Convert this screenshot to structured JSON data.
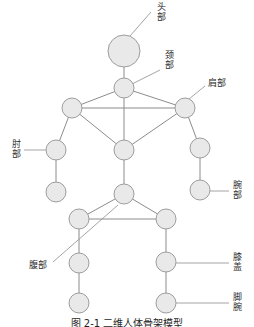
{
  "figure": {
    "caption": "图 2-1  二维人体骨架模型",
    "background_color": "#ffffff",
    "node_fill": "#e9e9e9",
    "node_stroke": "#9d9d9d",
    "edge_color": "#8c8c8c",
    "leader_color": "#9a9a9a"
  },
  "joints": [
    {
      "id": "head",
      "name": "head-joint",
      "cx": 124,
      "cy": 51,
      "r": 16
    },
    {
      "id": "neck",
      "name": "neck-joint",
      "cx": 124,
      "cy": 88,
      "r": 10
    },
    {
      "id": "shoulder_left",
      "name": "left-shoulder-joint",
      "cx": 72,
      "cy": 108,
      "r": 10
    },
    {
      "id": "shoulder_right",
      "name": "right-shoulder-joint",
      "cx": 185,
      "cy": 108,
      "r": 10
    },
    {
      "id": "chest",
      "name": "chest-joint",
      "cx": 124,
      "cy": 150,
      "r": 10
    },
    {
      "id": "elbow_left",
      "name": "left-elbow-joint",
      "cx": 56,
      "cy": 150,
      "r": 10
    },
    {
      "id": "elbow_right",
      "name": "right-elbow-joint",
      "cx": 200,
      "cy": 148,
      "r": 10
    },
    {
      "id": "wrist_left",
      "name": "left-wrist-joint",
      "cx": 56,
      "cy": 192,
      "r": 10
    },
    {
      "id": "wrist_right",
      "name": "right-wrist-joint",
      "cx": 200,
      "cy": 190,
      "r": 10
    },
    {
      "id": "pelvis",
      "name": "pelvis-joint",
      "cx": 124,
      "cy": 194,
      "r": 10
    },
    {
      "id": "hip_left",
      "name": "left-hip-joint",
      "cx": 79,
      "cy": 219,
      "r": 10
    },
    {
      "id": "hip_right",
      "name": "right-hip-joint",
      "cx": 166,
      "cy": 219,
      "r": 10
    },
    {
      "id": "knee_left",
      "name": "left-knee-joint",
      "cx": 79,
      "cy": 263,
      "r": 10
    },
    {
      "id": "knee_right",
      "name": "right-knee-joint",
      "cx": 166,
      "cy": 262,
      "r": 10
    },
    {
      "id": "ankle_left",
      "name": "left-ankle-joint",
      "cx": 79,
      "cy": 303,
      "r": 10
    },
    {
      "id": "ankle_right",
      "name": "right-ankle-joint",
      "cx": 166,
      "cy": 303,
      "r": 10
    }
  ],
  "edges": [
    {
      "name": "edge-head-neck",
      "from": "head",
      "to": "neck"
    },
    {
      "name": "edge-neck-left-shoulder",
      "from": "neck",
      "to": "shoulder_left"
    },
    {
      "name": "edge-neck-right-shoulder",
      "from": "neck",
      "to": "shoulder_right"
    },
    {
      "name": "edge-neck-chest",
      "from": "neck",
      "to": "chest"
    },
    {
      "name": "edge-left-shoulder-right-shoulder",
      "from": "shoulder_left",
      "to": "shoulder_right"
    },
    {
      "name": "edge-left-shoulder-chest",
      "from": "shoulder_left",
      "to": "chest"
    },
    {
      "name": "edge-right-shoulder-chest",
      "from": "shoulder_right",
      "to": "chest"
    },
    {
      "name": "edge-left-shoulder-left-elbow",
      "from": "shoulder_left",
      "to": "elbow_left"
    },
    {
      "name": "edge-right-shoulder-right-elbow",
      "from": "shoulder_right",
      "to": "elbow_right"
    },
    {
      "name": "edge-left-elbow-left-wrist",
      "from": "elbow_left",
      "to": "wrist_left"
    },
    {
      "name": "edge-right-elbow-right-wrist",
      "from": "elbow_right",
      "to": "wrist_right"
    },
    {
      "name": "edge-chest-pelvis",
      "from": "chest",
      "to": "pelvis"
    },
    {
      "name": "edge-pelvis-left-hip",
      "from": "pelvis",
      "to": "hip_left"
    },
    {
      "name": "edge-pelvis-right-hip",
      "from": "pelvis",
      "to": "hip_right"
    },
    {
      "name": "edge-left-hip-right-hip",
      "from": "hip_left",
      "to": "hip_right"
    },
    {
      "name": "edge-left-hip-left-knee",
      "from": "hip_left",
      "to": "knee_left"
    },
    {
      "name": "edge-right-hip-right-knee",
      "from": "hip_right",
      "to": "knee_right"
    },
    {
      "name": "edge-left-knee-left-ankle",
      "from": "knee_left",
      "to": "ankle_left"
    },
    {
      "name": "edge-right-knee-right-ankle",
      "from": "knee_right",
      "to": "ankle_right"
    }
  ],
  "annotations": [
    {
      "id": "head",
      "name": "annotation-head",
      "text": "头\n部",
      "orientation": "vertical",
      "left": 156,
      "top": 2,
      "leader": {
        "x1": 151,
        "y1": 12,
        "x2": 130,
        "y2": 36
      }
    },
    {
      "id": "neck",
      "name": "annotation-neck",
      "text": "颈\n部",
      "orientation": "vertical",
      "left": 164,
      "top": 50,
      "leader": {
        "x1": 160,
        "y1": 70,
        "x2": 132,
        "y2": 84
      }
    },
    {
      "id": "shoulder",
      "name": "annotation-shoulder",
      "text": "肩部",
      "orientation": "horizontal",
      "left": 208,
      "top": 78,
      "leader": {
        "x1": 205,
        "y1": 86,
        "x2": 189,
        "y2": 99
      }
    },
    {
      "id": "elbow",
      "name": "annotation-elbow",
      "text": "肘\n部",
      "orientation": "vertical",
      "left": 11,
      "top": 139,
      "leader": {
        "x1": 24,
        "y1": 150,
        "x2": 46,
        "y2": 150
      }
    },
    {
      "id": "wrist",
      "name": "annotation-wrist",
      "text": "腕\n部",
      "orientation": "vertical",
      "left": 232,
      "top": 180,
      "leader": {
        "x1": 229,
        "y1": 191,
        "x2": 210,
        "y2": 191
      }
    },
    {
      "id": "abdomen",
      "name": "annotation-abdomen",
      "text": "腹部",
      "orientation": "horizontal",
      "left": 29,
      "top": 260,
      "leader": {
        "x1": 53,
        "y1": 262,
        "x2": 118,
        "y2": 205
      }
    },
    {
      "id": "knee",
      "name": "annotation-knee",
      "text": "膝\n盖",
      "orientation": "vertical",
      "left": 232,
      "top": 252,
      "leader": {
        "x1": 229,
        "y1": 263,
        "x2": 176,
        "y2": 263
      }
    },
    {
      "id": "ankle",
      "name": "annotation-ankle",
      "text": "脚\n腕",
      "orientation": "vertical",
      "left": 232,
      "top": 292,
      "leader": {
        "x1": 229,
        "y1": 303,
        "x2": 176,
        "y2": 303
      }
    }
  ]
}
